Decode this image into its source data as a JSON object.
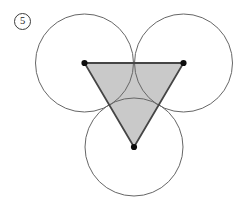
{
  "figure": {
    "label": "5",
    "background_color": "#ffffff"
  },
  "geometry": {
    "canvas": {
      "width": 246,
      "height": 211
    },
    "circle_radius": 49,
    "circle_stroke_color": "#666666",
    "circle_stroke_width": 1,
    "circles": [
      {
        "name": "top-left",
        "cx": 84.5,
        "cy": 63
      },
      {
        "name": "top-right",
        "cx": 183.5,
        "cy": 63
      },
      {
        "name": "bottom",
        "cx": 134,
        "cy": 147
      }
    ],
    "triangle": {
      "vertices": [
        [
          84.5,
          63
        ],
        [
          183.5,
          63
        ],
        [
          134,
          147
        ]
      ],
      "fill_color": "#c9c9c9",
      "stroke_color": "#454545",
      "stroke_width": 1.8
    },
    "vertex_dots": {
      "radius": 3.1,
      "color": "#0d0d0d",
      "positions": [
        {
          "name": "left",
          "cx": 84.5,
          "cy": 63
        },
        {
          "name": "right",
          "cx": 183.5,
          "cy": 63
        },
        {
          "name": "bottom",
          "cx": 134,
          "cy": 147
        }
      ]
    }
  }
}
